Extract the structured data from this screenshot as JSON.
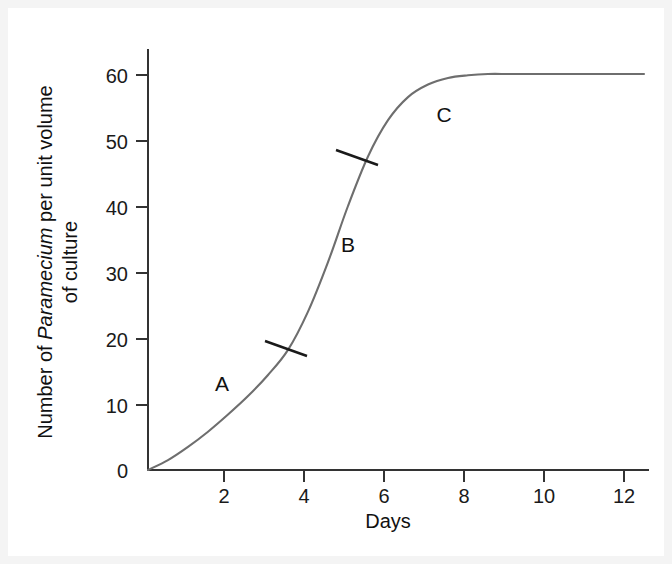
{
  "figure": {
    "background_color": "#f4f4f4",
    "panel_color": "#ffffff",
    "curve_color": "#6e6e6e",
    "axis_color": "#333333",
    "text_color": "#111111"
  },
  "chart_data": {
    "type": "line",
    "title": "",
    "subtitle": "",
    "xlabel": "Days",
    "ylabel_parts": {
      "segment1": "Number of ",
      "segment2_italic": "Paramecium",
      "segment3": " per unit volume",
      "line2": "of culture"
    },
    "ylabel": "Number of Paramecium per unit volume of culture",
    "xlim": [
      0,
      12.4
    ],
    "ylim": [
      0,
      63
    ],
    "xticks": [
      2,
      4,
      6,
      8,
      10,
      12
    ],
    "xtick_labels": [
      "2",
      "4",
      "6",
      "8",
      "10",
      "12"
    ],
    "yticks": [
      0,
      10,
      20,
      30,
      40,
      50,
      60
    ],
    "ytick_labels": [
      "0",
      "10",
      "20",
      "30",
      "40",
      "50",
      "60"
    ],
    "grid": false,
    "legend": false,
    "series": [
      {
        "name": "Paramecium population growth",
        "x": [
          0,
          0.5,
          1,
          1.5,
          2,
          2.5,
          3,
          3.5,
          4,
          4.5,
          5,
          5.5,
          6,
          6.5,
          7,
          7.5,
          8,
          8.5,
          9,
          9.5,
          10,
          10.5,
          11,
          11.5,
          12,
          12.4
        ],
        "y": [
          0,
          1.5,
          3.5,
          5.8,
          8.4,
          11.2,
          14.4,
          18.2,
          24.0,
          31.5,
          40.0,
          47.5,
          53.0,
          56.5,
          58.4,
          59.4,
          59.8,
          60.0,
          60.0,
          60.0,
          60.0,
          60.0,
          60.0,
          60.0,
          60.0,
          60.0
        ]
      }
    ],
    "annotations": [
      {
        "id": "phase-a",
        "label": "A",
        "x": 1.85,
        "y": 12.8,
        "description": "lag phase region label"
      },
      {
        "id": "phase-b",
        "label": "B",
        "x": 5.0,
        "y": 34.5,
        "description": "exponential phase region label"
      },
      {
        "id": "phase-c",
        "label": "C",
        "x": 7.4,
        "y": 54.0,
        "description": "stationary phase region label"
      }
    ],
    "divider_marks": [
      {
        "id": "divider-1",
        "x": 3.5,
        "y": 18.5,
        "description": "slash separating phase A from phase B"
      },
      {
        "id": "divider-2",
        "x": 5.25,
        "y": 47.0,
        "description": "slash separating phase B from phase C"
      }
    ]
  }
}
